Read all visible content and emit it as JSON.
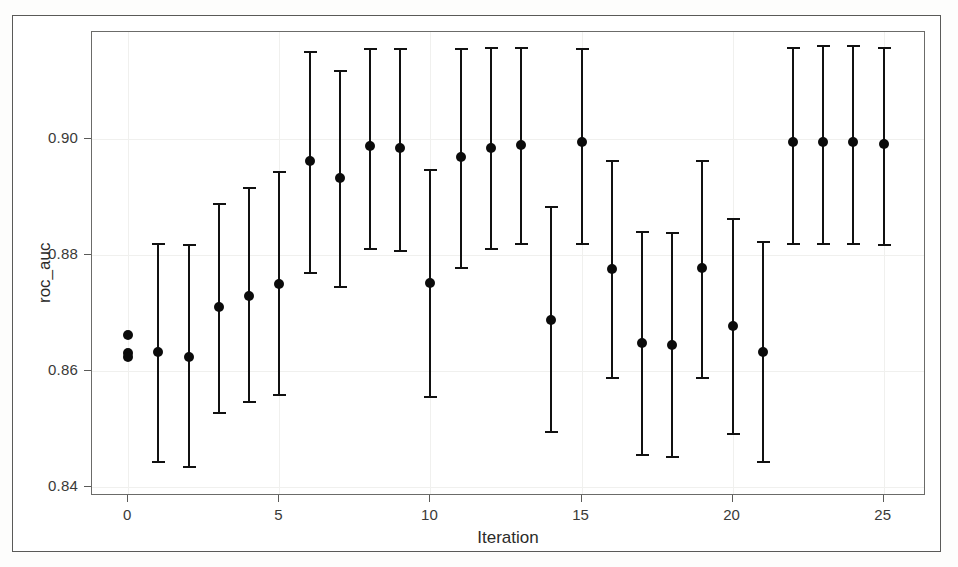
{
  "chart_data": {
    "type": "scatter",
    "title": "",
    "subtitle": "",
    "xlabel": "Iteration",
    "ylabel": "roc_auc",
    "grid": true,
    "legend": null,
    "error_bar_style": "capped vertical interval",
    "xlim": [
      -1.2,
      26.4
    ],
    "ylim": [
      0.8385,
      0.9185
    ],
    "xticks": [
      0,
      5,
      10,
      15,
      20,
      25
    ],
    "xtick_labels": [
      "0",
      "5",
      "10",
      "15",
      "20",
      "25"
    ],
    "yticks": [
      0.84,
      0.86,
      0.88,
      0.9
    ],
    "ytick_labels": [
      "0.84",
      "0.86",
      "0.88",
      "0.90"
    ],
    "marker": {
      "shape": "circle",
      "color": "#0b0b0b",
      "size": 10
    },
    "line_color": "#111111",
    "points": [
      {
        "x": 0,
        "y": 0.8663,
        "lo": null,
        "hi": null,
        "note": "initial point, no error bar"
      },
      {
        "x": 0,
        "y": 0.8631,
        "lo": null,
        "hi": null,
        "note": "initial point, no error bar"
      },
      {
        "x": 0,
        "y": 0.8625,
        "lo": null,
        "hi": null,
        "note": "initial point, no error bar"
      },
      {
        "x": 1,
        "y": 0.8634,
        "lo": 0.8443,
        "hi": 0.8822
      },
      {
        "x": 2,
        "y": 0.8625,
        "lo": 0.8435,
        "hi": 0.882
      },
      {
        "x": 3,
        "y": 0.8711,
        "lo": 0.8528,
        "hi": 0.889
      },
      {
        "x": 4,
        "y": 0.873,
        "lo": 0.8547,
        "hi": 0.8917
      },
      {
        "x": 5,
        "y": 0.8751,
        "lo": 0.856,
        "hi": 0.8945
      },
      {
        "x": 6,
        "y": 0.8962,
        "lo": 0.877,
        "hi": 0.9152
      },
      {
        "x": 7,
        "y": 0.8933,
        "lo": 0.8745,
        "hi": 0.912
      },
      {
        "x": 8,
        "y": 0.8988,
        "lo": 0.8811,
        "hi": 0.9158
      },
      {
        "x": 9,
        "y": 0.8985,
        "lo": 0.8807,
        "hi": 0.9158
      },
      {
        "x": 10,
        "y": 0.8752,
        "lo": 0.8555,
        "hi": 0.8948
      },
      {
        "x": 11,
        "y": 0.897,
        "lo": 0.8778,
        "hi": 0.9158
      },
      {
        "x": 12,
        "y": 0.8985,
        "lo": 0.8811,
        "hi": 0.916
      },
      {
        "x": 13,
        "y": 0.8991,
        "lo": 0.882,
        "hi": 0.916
      },
      {
        "x": 14,
        "y": 0.8689,
        "lo": 0.8495,
        "hi": 0.8885
      },
      {
        "x": 15,
        "y": 0.8995,
        "lo": 0.882,
        "hi": 0.9157
      },
      {
        "x": 16,
        "y": 0.8777,
        "lo": 0.8588,
        "hi": 0.8965
      },
      {
        "x": 17,
        "y": 0.8648,
        "lo": 0.8455,
        "hi": 0.8842
      },
      {
        "x": 18,
        "y": 0.8645,
        "lo": 0.8452,
        "hi": 0.884
      },
      {
        "x": 19,
        "y": 0.8778,
        "lo": 0.8588,
        "hi": 0.8965
      },
      {
        "x": 20,
        "y": 0.8678,
        "lo": 0.8492,
        "hi": 0.8865
      },
      {
        "x": 21,
        "y": 0.8634,
        "lo": 0.8443,
        "hi": 0.8825
      },
      {
        "x": 22,
        "y": 0.8995,
        "lo": 0.882,
        "hi": 0.916
      },
      {
        "x": 23,
        "y": 0.8996,
        "lo": 0.882,
        "hi": 0.9163
      },
      {
        "x": 24,
        "y": 0.8996,
        "lo": 0.882,
        "hi": 0.9163
      },
      {
        "x": 25,
        "y": 0.8992,
        "lo": 0.8818,
        "hi": 0.916
      }
    ]
  }
}
